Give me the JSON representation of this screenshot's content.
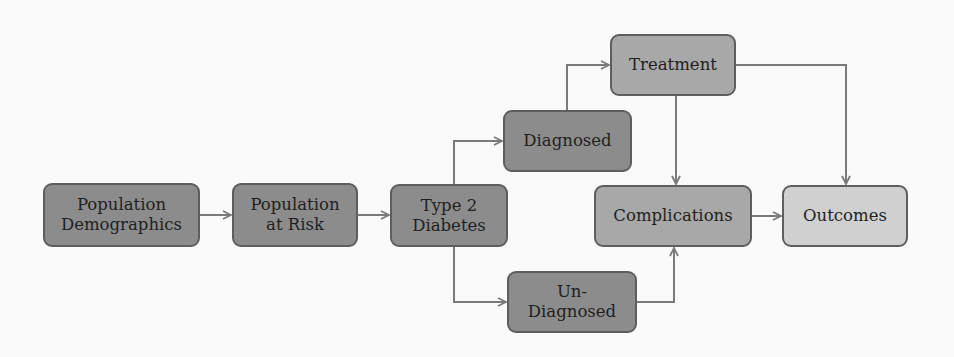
{
  "diagram": {
    "nodes": [
      {
        "id": "demographics",
        "label": "Population\nDemographics",
        "shade": "dark"
      },
      {
        "id": "at-risk",
        "label": "Population\nat Risk",
        "shade": "dark"
      },
      {
        "id": "type2",
        "label": "Type 2\nDiabetes",
        "shade": "dark"
      },
      {
        "id": "diagnosed",
        "label": "Diagnosed",
        "shade": "dark"
      },
      {
        "id": "undiagnosed",
        "label": "Un-\nDiagnosed",
        "shade": "dark"
      },
      {
        "id": "treatment",
        "label": "Treatment",
        "shade": "mid"
      },
      {
        "id": "complications",
        "label": "Complications",
        "shade": "mid"
      },
      {
        "id": "outcomes",
        "label": "Outcomes",
        "shade": "light"
      }
    ],
    "edges": [
      {
        "from": "demographics",
        "to": "at-risk"
      },
      {
        "from": "at-risk",
        "to": "type2"
      },
      {
        "from": "type2",
        "to": "diagnosed"
      },
      {
        "from": "type2",
        "to": "undiagnosed"
      },
      {
        "from": "diagnosed",
        "to": "treatment"
      },
      {
        "from": "treatment",
        "to": "complications"
      },
      {
        "from": "treatment",
        "to": "outcomes"
      },
      {
        "from": "undiagnosed",
        "to": "complications"
      },
      {
        "from": "complications",
        "to": "outcomes"
      }
    ],
    "colors": {
      "dark": "#8c8c8c",
      "mid": "#a8a8a8",
      "light": "#d0d0d0",
      "border": "#5e5e5e",
      "arrow": "#7a7a7a"
    }
  }
}
